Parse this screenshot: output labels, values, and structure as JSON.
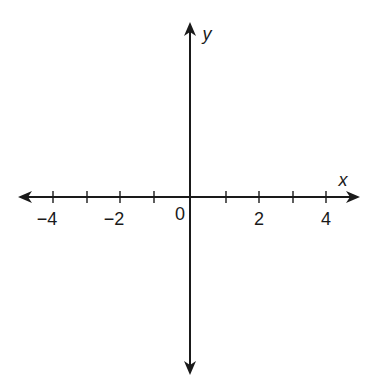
{
  "diagram": {
    "type": "coordinate-plane",
    "axes": {
      "x_label": "x",
      "y_label": "y",
      "origin_label": "0",
      "x_range": [
        -5,
        5
      ],
      "tick_step": 1,
      "x_tick_labels": [
        {
          "value": -4,
          "text": "−4"
        },
        {
          "value": -2,
          "text": "−2"
        },
        {
          "value": 2,
          "text": "2"
        },
        {
          "value": 4,
          "text": "4"
        }
      ],
      "unlabeled_ticks": [
        -3,
        -1,
        1,
        3
      ],
      "color": "#1a1a1a"
    }
  }
}
